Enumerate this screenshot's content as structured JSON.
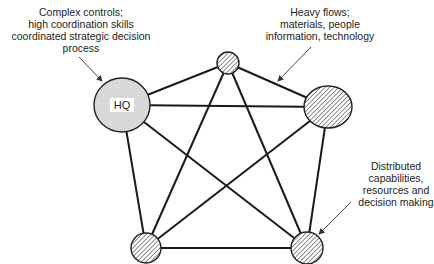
{
  "diagram": {
    "type": "network",
    "nodes": [
      {
        "id": "hq",
        "label": "HQ",
        "cx": 122,
        "cy": 105,
        "rx": 28,
        "ry": 27,
        "fill": "#d9d9d9",
        "pattern": "solid"
      },
      {
        "id": "top",
        "label": "",
        "cx": 228,
        "cy": 63,
        "rx": 11,
        "ry": 11,
        "pattern": "hatched"
      },
      {
        "id": "right",
        "label": "",
        "cx": 328,
        "cy": 107,
        "rx": 24,
        "ry": 21,
        "pattern": "hatched"
      },
      {
        "id": "bottom-left",
        "label": "",
        "cx": 146,
        "cy": 248,
        "rx": 15,
        "ry": 15,
        "pattern": "hatched"
      },
      {
        "id": "bottom-right",
        "label": "",
        "cx": 307,
        "cy": 248,
        "rx": 16,
        "ry": 16,
        "pattern": "hatched"
      }
    ],
    "edges": [
      [
        "hq",
        "top"
      ],
      [
        "hq",
        "right"
      ],
      [
        "hq",
        "bottom-left"
      ],
      [
        "hq",
        "bottom-right"
      ],
      [
        "top",
        "right"
      ],
      [
        "top",
        "bottom-left"
      ],
      [
        "top",
        "bottom-right"
      ],
      [
        "right",
        "bottom-left"
      ],
      [
        "right",
        "bottom-right"
      ],
      [
        "bottom-left",
        "bottom-right"
      ]
    ],
    "colors": {
      "line": "#1a1a1a",
      "hq_fill": "#d9d9d9",
      "hatch": "#333333",
      "background": "#ffffff"
    }
  },
  "hq_label": "HQ",
  "annotations": {
    "hq_note": {
      "lines": [
        "Complex controls;",
        "high coordination skills",
        "coordinated strategic decision",
        "process"
      ],
      "target": "hq"
    },
    "flows_note": {
      "lines": [
        "Heavy flows;",
        "materials, people",
        "information, technology"
      ],
      "target": "edge top-right"
    },
    "distributed_note": {
      "lines": [
        "Distributed",
        "capabilities,",
        "resources and",
        "decision making"
      ],
      "target": "bottom-right"
    }
  }
}
